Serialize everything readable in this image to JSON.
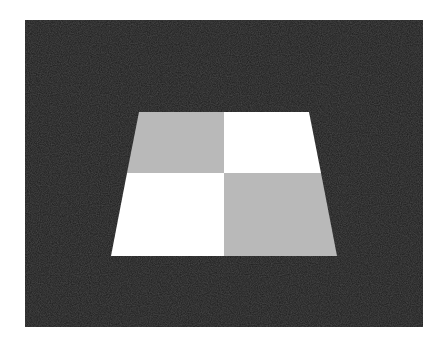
{
  "figure": {
    "colors": {
      "page_background": "#ffffff",
      "panel_background": "#1c1c1c",
      "light_tile": "#ffffff",
      "gray_tile": "#b9b9b9"
    },
    "panel": {
      "x": 25,
      "y": 20,
      "width": 398,
      "height": 307
    },
    "trapezoid": {
      "top_left": [
        139,
        112
      ],
      "top_right": [
        309,
        112
      ],
      "bottom_right": [
        337,
        256
      ],
      "bottom_left": [
        111,
        256
      ]
    },
    "tiles": [
      {
        "position": "top-left",
        "color": "gray"
      },
      {
        "position": "top-right",
        "color": "white"
      },
      {
        "position": "bottom-left",
        "color": "white"
      },
      {
        "position": "bottom-right",
        "color": "gray"
      }
    ]
  }
}
